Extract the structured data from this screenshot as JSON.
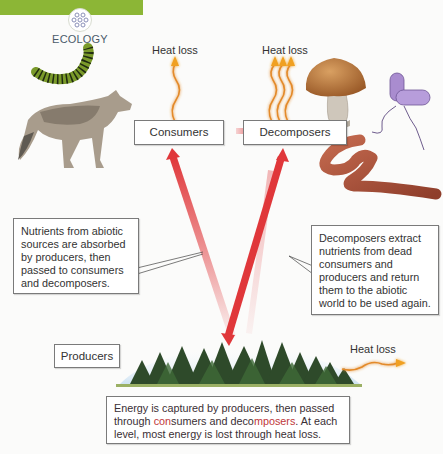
{
  "header": {
    "section_label": "ECOLOGY",
    "section_icon": "molecule-cluster-icon",
    "accent_color": "#8cb636"
  },
  "nodes": {
    "consumers": "Consumers",
    "decomposers": "Decomposers",
    "producers": "Producers"
  },
  "heat_labels": {
    "consumers": "Heat loss",
    "decomposers": "Heat loss",
    "producers": "Heat loss"
  },
  "callouts": {
    "left": "Nutrients from abiotic sources are absorbed by producers, then passed to consumers and decomposers.",
    "right": "Decomposers extract nutrients from dead consumers and producers and return them to the abiotic world to be used again."
  },
  "caption": {
    "part1": "Energy is captured by producers, then passed through ",
    "hl1_a": "con",
    "hl1_b": "sumers",
    "mid": " and deco",
    "hl2": "mposers",
    "part2": ". At each level, most energy is lost through heat loss."
  },
  "illustrations": {
    "consumers": [
      "caterpillar",
      "wolf"
    ],
    "decomposers": [
      "mushroom",
      "bacterium",
      "earthworm"
    ],
    "producers": [
      "forest"
    ]
  },
  "colors": {
    "nutrient_arrow": "#e0373a",
    "heat_wave": "#f0a020",
    "box_border": "#7a7a7a"
  }
}
